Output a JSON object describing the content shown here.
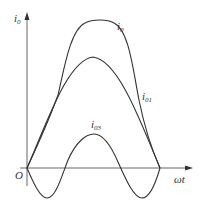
{
  "diagram": {
    "type": "waveform",
    "axes": {
      "y_label": "i",
      "y_label_sub": "0",
      "x_label": "ωt",
      "origin_label": "O"
    },
    "curves": [
      {
        "id": "i0",
        "label": "i",
        "label_sub": "0",
        "description": "total current, flattened-peak waveform (i0 = i01 + i03)"
      },
      {
        "id": "i01",
        "label": "i",
        "label_sub": "01",
        "description": "fundamental sinusoid"
      },
      {
        "id": "i03",
        "label": "i",
        "label_sub": "03",
        "description": "third harmonic component"
      }
    ],
    "colors": {
      "stroke": "#333333",
      "axis": "#555555",
      "background": "#ffffff"
    }
  }
}
